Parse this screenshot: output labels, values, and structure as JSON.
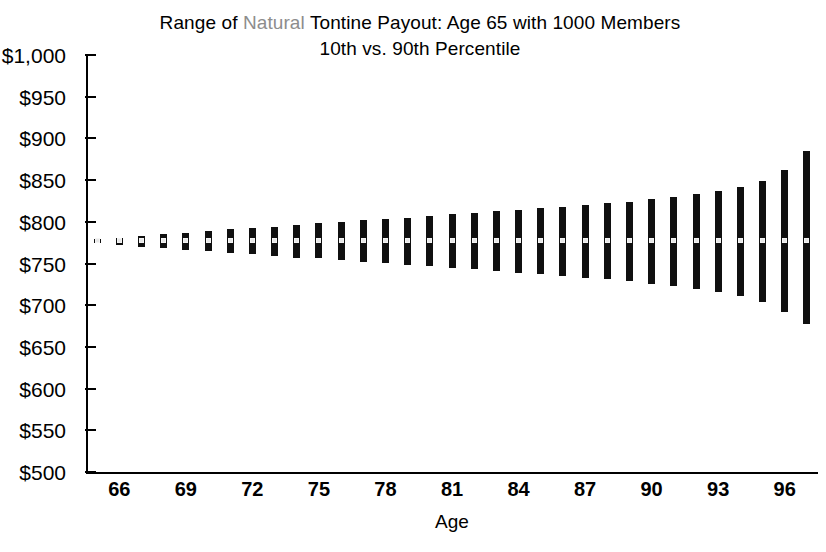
{
  "chart_data": {
    "type": "bar",
    "title": "Range of Natural Tontine Payout: Age 65 with 1000 Members",
    "title_line1_pre": "Range of ",
    "title_line1_accent": "Natural",
    "title_line1_post": " Tontine Payout: Age 65 with 1000 Members",
    "subtitle": "10th vs. 90th Percentile",
    "xlabel": "Age",
    "ylabel": "",
    "xlim": [
      64.5,
      97.5
    ],
    "ylim": [
      500,
      1000
    ],
    "grid": false,
    "legend": "none",
    "accent_color": "#8d8d8d",
    "bar_color": "#101010",
    "marker_color": "#e8e8e8",
    "ytick_labels": [
      "$1,000",
      "$950",
      "$900",
      "$850",
      "$800",
      "$750",
      "$700",
      "$650",
      "$600",
      "$550",
      "$500"
    ],
    "ytick_values": [
      1000,
      950,
      900,
      850,
      800,
      750,
      700,
      650,
      600,
      550,
      500
    ],
    "xtick_labels": [
      "66",
      "69",
      "72",
      "75",
      "78",
      "81",
      "84",
      "87",
      "90",
      "93",
      "96"
    ],
    "xtick_values": [
      66,
      69,
      72,
      75,
      78,
      81,
      84,
      87,
      90,
      93,
      96
    ],
    "categories": [
      65,
      66,
      67,
      68,
      69,
      70,
      71,
      72,
      73,
      74,
      75,
      76,
      77,
      78,
      79,
      80,
      81,
      82,
      83,
      84,
      85,
      86,
      87,
      88,
      89,
      90,
      91,
      92,
      93,
      94,
      95,
      96,
      97
    ],
    "series": [
      {
        "name": "90th Percentile",
        "values": [
          779,
          781,
          783,
          785,
          787,
          789,
          791,
          792,
          794,
          796,
          798,
          800,
          802,
          803,
          805,
          807,
          809,
          811,
          813,
          814,
          816,
          818,
          820,
          822,
          824,
          827,
          830,
          833,
          837,
          842,
          849,
          862,
          885
        ]
      },
      {
        "name": "Median",
        "values": [
          777,
          777,
          777,
          777,
          777,
          777,
          777,
          777,
          777,
          777,
          777,
          777,
          777,
          777,
          777,
          777,
          777,
          777,
          777,
          777,
          777,
          777,
          777,
          777,
          777,
          777,
          777,
          777,
          777,
          777,
          777,
          777,
          777
        ]
      },
      {
        "name": "10th Percentile",
        "values": [
          774,
          772,
          770,
          768,
          766,
          765,
          763,
          761,
          759,
          757,
          756,
          754,
          752,
          750,
          748,
          747,
          745,
          743,
          741,
          739,
          737,
          735,
          733,
          731,
          729,
          726,
          723,
          720,
          716,
          711,
          704,
          692,
          678
        ]
      }
    ]
  }
}
